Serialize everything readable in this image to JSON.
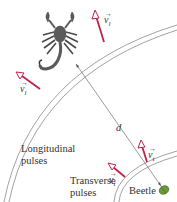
{
  "diagram": {
    "title": "",
    "colors": {
      "velocity_arrow": "#c0224a",
      "pulse_arc": "#8a8a8a",
      "distance_line": "#555555",
      "scorpion": "#5a5a5a",
      "beetle": "#6a9a3a",
      "text": "#333333"
    },
    "labels": {
      "longitudinal_line1": "Longitudinal",
      "longitudinal_line2": "pulses",
      "transverse_line1": "Transverse",
      "transverse_line2": "pulses",
      "beetle": "Beetle",
      "distance": "d"
    },
    "vectors": [
      {
        "id": "vl-top",
        "symbol": "v",
        "subscript": "l",
        "meaning": "longitudinal pulse velocity"
      },
      {
        "id": "vl-left",
        "symbol": "v",
        "subscript": "l",
        "meaning": "longitudinal pulse velocity"
      },
      {
        "id": "vt-right",
        "symbol": "v",
        "subscript": "t",
        "meaning": "transverse pulse velocity"
      },
      {
        "id": "vt-left",
        "symbol": "v",
        "subscript": "t",
        "meaning": "transverse pulse velocity"
      }
    ],
    "icons": [
      "scorpion-icon",
      "beetle-icon"
    ]
  }
}
